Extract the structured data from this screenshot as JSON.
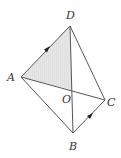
{
  "diagram": {
    "type": "geometry",
    "points": {
      "A": {
        "label": "A",
        "x": 21,
        "y": 77
      },
      "B": {
        "label": "B",
        "x": 73,
        "y": 133
      },
      "C": {
        "label": "C",
        "x": 105,
        "y": 100
      },
      "D": {
        "label": "D",
        "x": 70,
        "y": 26
      },
      "O": {
        "label": "O",
        "x": 72,
        "y": 90
      }
    },
    "segments": [
      "AD",
      "DC",
      "CB",
      "BA",
      "AC",
      "DB"
    ],
    "arrows": [
      "AD",
      "BC"
    ],
    "shaded_region": "AOD",
    "colors": {
      "line": "#555555",
      "shade": "#e4e4e4",
      "label": "#333333"
    }
  }
}
